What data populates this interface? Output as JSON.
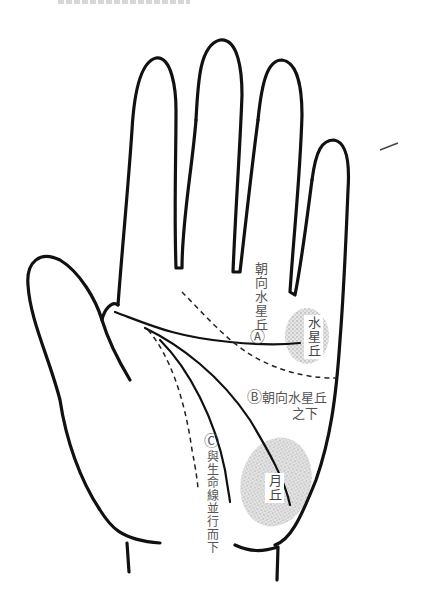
{
  "figure": {
    "title_partial": ""
  },
  "labels": {
    "a": {
      "marker": "Ⓐ",
      "text": "朝向水星丘"
    },
    "b": {
      "marker": "Ⓑ",
      "line1": "朝向水星丘",
      "line2": "之下"
    },
    "c": {
      "marker": "Ⓒ",
      "text": "與生命線並行而下"
    }
  },
  "mounts": {
    "mercury": {
      "text": "水星丘",
      "color": "#c9c9c9"
    },
    "moon": {
      "text": "月丘",
      "color": "#c9c9c9"
    }
  },
  "colors": {
    "outline": "#111111",
    "text": "#555555",
    "mount_fill": "#cfcfcf"
  }
}
